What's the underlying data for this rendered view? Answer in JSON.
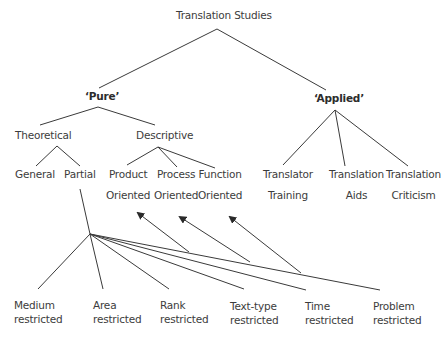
{
  "diagram": {
    "title": "Translation Studies",
    "branches": {
      "pure": {
        "label": "‘Pure’",
        "theoretical": {
          "label": "Theoretical",
          "general": "General",
          "partial": "Partial"
        },
        "descriptive": {
          "label": "Descriptive",
          "product": {
            "line1": "Product",
            "line2": "Oriented"
          },
          "process": {
            "line1": "Process",
            "line2": "Oriented"
          },
          "function": {
            "line1": "Function",
            "line2": "Oriented"
          }
        }
      },
      "applied": {
        "label": "‘Applied’",
        "training": {
          "line1": "Translator",
          "line2": "Training"
        },
        "aids": {
          "line1": "Translation",
          "line2": "Aids"
        },
        "criticism": {
          "line1": "Translation",
          "line2": "Criticism"
        }
      }
    },
    "restrictions": [
      {
        "line1": "Medium",
        "line2": "restricted"
      },
      {
        "line1": "Area",
        "line2": "restricted"
      },
      {
        "line1": "Rank",
        "line2": "restricted"
      },
      {
        "line1": "Text-type",
        "line2": "restricted"
      },
      {
        "line1": "Time",
        "line2": "restricted"
      },
      {
        "line1": "Problem",
        "line2": "restricted"
      }
    ],
    "colors": {
      "line": "#3a3a3a",
      "text": "#3c3c3c",
      "background": "#ffffff"
    }
  }
}
